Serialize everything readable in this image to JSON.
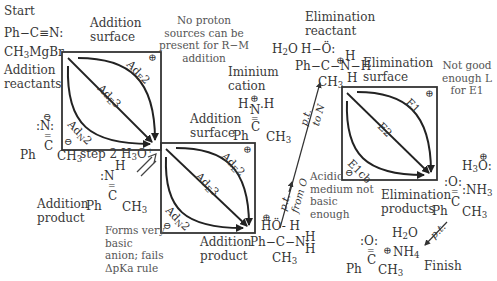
{
  "labels": {
    "start": "Start",
    "start_molecule_1": "Ph−C≡N:",
    "start_molecule_2": "CH₃MgBr",
    "addition_reactants": "Addition reactants",
    "addition_surface_1": "Addition surface",
    "addition_surface_2": "Addition surface",
    "no_proton_note": "No proton sources can be present for R−M addition",
    "iminium_cation": "Iminium cation",
    "step2": "step 2 H₃O⁺",
    "addition_product_1": "Addition product",
    "addition_product_2": "Addition product",
    "forms_basic_anion_note": "Forms very basic anion; fails ΔpKa rule",
    "elimination_reactant": "Elimination reactant",
    "elimination_surface": "Elimination surface",
    "not_good_L_note": "Not good enough L for E1",
    "acidic_medium_note": "Acidic medium not basic enough",
    "elimination_products": "Elimination products",
    "finish": "Finish",
    "pt_from_O": "p.t. from O",
    "pt_to_N": "p.t. to N",
    "pt": "p.t."
  },
  "surfaces": [
    {
      "name": "addition-surface-1",
      "paths": [
        "AdE2",
        "AdE3",
        "AdN2"
      ],
      "top_right_charge": "⊕",
      "bottom_left_charge": "⊖"
    },
    {
      "name": "addition-surface-2",
      "paths": [
        "AdE2",
        "AdE3",
        "AdN2"
      ],
      "top_right_charge": "⊕",
      "bottom_left_charge": "⊖"
    },
    {
      "name": "elimination-surface",
      "paths": [
        "E1",
        "E2",
        "E1cb"
      ],
      "top_right_charge": "⊕",
      "bottom_left_charge": "⊖"
    }
  ],
  "molecules": {
    "imine_anion": {
      "top": ":N:",
      "charge": "⊖",
      "bottom": "Ph C CH₃"
    },
    "imine": {
      "top": ":N H",
      "bottom": "Ph C CH₃"
    },
    "iminium": {
      "top": "H N H",
      "charge": "⊕",
      "bottom": "Ph C CH₃"
    },
    "elim_reactant": {
      "row1": "H−Ö:",
      "row2": "Ph−C−N−H",
      "row3": "CH₃",
      "water": "H₂O"
    },
    "add_product_2": {
      "row1": "HÖ−H",
      "row2": "Ph−C−N−H",
      "row3": "CH₃"
    },
    "elim_products": {
      "hydronium": "H₃O:",
      "ketone_top": ":O:",
      "ammonia": ":NH₃",
      "bottom": "Ph C CH₃"
    },
    "final": {
      "ketone_top": ":O:",
      "water": "H₂O",
      "ammonium": "NH₄",
      "bottom": "Ph C CH₃"
    }
  }
}
